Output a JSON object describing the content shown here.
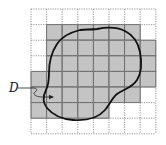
{
  "figure": {
    "label": "D",
    "grid": {
      "rows": 8,
      "cols": 8,
      "origin_x": 31,
      "origin_y": 9,
      "cell_size": 15.6,
      "line_style": "dotted",
      "line_color": "#8a8a8a"
    },
    "shaded_cells": {
      "fill_color": "#c4c4c4",
      "border_color": "#5a5a5a",
      "rows": [
        {
          "row": 1,
          "from_col": 1,
          "to_col": 6
        },
        {
          "row": 2,
          "from_col": 1,
          "to_col": 7
        },
        {
          "row": 3,
          "from_col": 1,
          "to_col": 7
        },
        {
          "row": 4,
          "from_col": 0,
          "to_col": 7
        },
        {
          "row": 5,
          "from_col": 0,
          "to_col": 6
        },
        {
          "row": 6,
          "from_col": 0,
          "to_col": 4
        }
      ]
    },
    "curve_color": "#111111"
  }
}
